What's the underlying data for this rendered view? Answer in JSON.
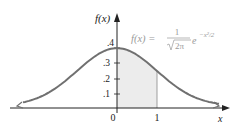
{
  "chart_data": {
    "type": "area",
    "title": "",
    "function_label": "f(x) = 1/√(2π) e^(−x²/2)",
    "formula": {
      "lhs": "f(x) =",
      "numerator": "1",
      "denominator": "2π",
      "exp_base": "e",
      "exponent": "−x²/2"
    },
    "xlabel": "x",
    "ylabel": "f(x)",
    "x_ticks": [
      "0",
      "1"
    ],
    "y_ticks": [
      ".1",
      ".2",
      ".3",
      ".4"
    ],
    "y_tick_values": [
      0.1,
      0.2,
      0.3,
      0.4
    ],
    "xlim": [
      -3.5,
      3.5
    ],
    "ylim": [
      0,
      0.45
    ],
    "shaded_region": {
      "from": 0,
      "to": 1,
      "area": 0.3413
    },
    "series": [
      {
        "name": "standard normal density",
        "x": [
          -3.0,
          -2.5,
          -2.0,
          -1.5,
          -1.0,
          -0.5,
          0.0,
          0.5,
          1.0,
          1.5,
          2.0,
          2.5,
          3.0
        ],
        "values": [
          0.0044,
          0.0175,
          0.054,
          0.1295,
          0.242,
          0.3521,
          0.3989,
          0.3521,
          0.242,
          0.1295,
          0.054,
          0.0175,
          0.0044
        ]
      }
    ],
    "grid": false,
    "legend": "none",
    "colors": {
      "curve": "#707070",
      "shade": "#ebebeb",
      "axis": "#222222",
      "formula": "#9a9a9a"
    }
  }
}
